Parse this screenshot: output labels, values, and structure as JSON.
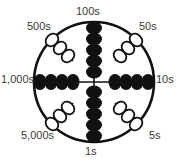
{
  "diagram": {
    "name": "circular-abacus-dial",
    "title": "",
    "colors": {
      "bead_filled": "#111111",
      "bead_open_stroke": "#111111",
      "bead_open_fill": "#ffffff",
      "ring_stroke": "#111111",
      "spoke_stroke": "#111111",
      "label_text": "#3a3a3a",
      "background": "#ffffff"
    },
    "geometry": {
      "center_x": 94,
      "center_y": 82,
      "ring_radius": 60,
      "ring_stroke_width": 2.6
    },
    "arms": [
      {
        "id": "arm-100s",
        "label": "100s",
        "position": "top",
        "angle_deg": 270,
        "bead_style": "filled",
        "bead_count": 5,
        "value": 100
      },
      {
        "id": "arm-50s",
        "label": "50s",
        "position": "upper-right",
        "angle_deg": 315,
        "bead_style": "open",
        "bead_count": 3,
        "value": 50
      },
      {
        "id": "arm-10s",
        "label": "10s",
        "position": "right",
        "angle_deg": 0,
        "bead_style": "filled",
        "bead_count": 4,
        "value": 10
      },
      {
        "id": "arm-5s",
        "label": "5s",
        "position": "lower-right",
        "angle_deg": 45,
        "bead_style": "open",
        "bead_count": 3,
        "value": 5
      },
      {
        "id": "arm-1s",
        "label": "1s",
        "position": "bottom",
        "angle_deg": 90,
        "bead_style": "filled",
        "bead_count": 5,
        "value": 1
      },
      {
        "id": "arm-5000s",
        "label": "5,000s",
        "position": "lower-left",
        "angle_deg": 135,
        "bead_style": "open",
        "bead_count": 3,
        "value": 5000
      },
      {
        "id": "arm-1000s",
        "label": "1,000s",
        "position": "left",
        "angle_deg": 180,
        "bead_style": "filled",
        "bead_count": 4,
        "value": 1000
      },
      {
        "id": "arm-500s",
        "label": "500s",
        "position": "upper-left",
        "angle_deg": 225,
        "bead_style": "open",
        "bead_count": 3,
        "value": 500
      }
    ]
  },
  "labels": {
    "top": "100s",
    "upper_left": "500s",
    "upper_right": "50s",
    "left": "1,000s",
    "right": "10s",
    "lower_left": "5,000s",
    "lower_right": "5s",
    "bottom": "1s"
  }
}
